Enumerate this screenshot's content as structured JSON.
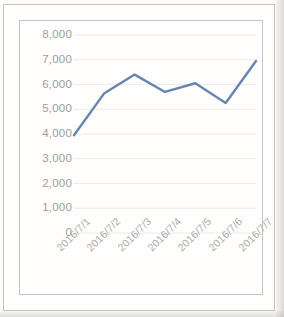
{
  "chart_data": {
    "type": "line",
    "title": "",
    "xlabel": "",
    "ylabel": "",
    "categories": [
      "2016/7/1",
      "2016/7/2",
      "2016/7/3",
      "2016/7/4",
      "2016/7/5",
      "2016/7/6",
      "2016/7/7"
    ],
    "values": [
      3950,
      5650,
      6400,
      5700,
      6050,
      5250,
      6950
    ],
    "series": [
      {
        "name": "",
        "values": [
          3950,
          5650,
          6400,
          5700,
          6050,
          5250,
          6950
        ]
      }
    ],
    "ylim": [
      0,
      8000
    ],
    "ytick_step": 1000,
    "ytick_labels": [
      "8,000",
      "7,000",
      "6,000",
      "5,000",
      "4,000",
      "3,000",
      "2,000",
      "1,000",
      "0"
    ],
    "ytick_values": [
      8000,
      7000,
      6000,
      5000,
      4000,
      3000,
      2000,
      1000,
      0
    ],
    "grid": true,
    "grid_axis": "horizontal",
    "legend": false,
    "legend_position": "none",
    "markers": false,
    "line_color": "#4a6fa5",
    "grid_color": "#e8eaec",
    "axis_label_color": "#8c8c8c",
    "plot_background": "#ffffff",
    "chart_border_color": "#a8bed6"
  },
  "document": {
    "page_background": "#fdfdfb",
    "frame_color": "#b9b9b5"
  }
}
